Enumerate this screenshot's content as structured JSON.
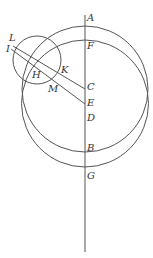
{
  "diagram": {
    "points": {
      "A": {
        "label": "A",
        "x": 88,
        "y": 13
      },
      "F": {
        "label": "F",
        "x": 88,
        "y": 41
      },
      "L": {
        "label": "L",
        "x": 6,
        "y": 61
      },
      "I": {
        "label": "I",
        "x": 4,
        "y": 70
      },
      "H": {
        "label": "H",
        "x": 31,
        "y": 70
      },
      "K": {
        "label": "K",
        "x": 60,
        "y": 67
      },
      "C": {
        "label": "C",
        "x": 86,
        "y": 84
      },
      "M": {
        "label": "M",
        "x": 47,
        "y": 84
      },
      "E": {
        "label": "E",
        "x": 86,
        "y": 99
      },
      "D": {
        "label": "D",
        "x": 86,
        "y": 113
      },
      "B": {
        "label": "B",
        "x": 86,
        "y": 143
      },
      "G": {
        "label": "G",
        "x": 86,
        "y": 171
      }
    },
    "stroke_color": "#555555"
  }
}
